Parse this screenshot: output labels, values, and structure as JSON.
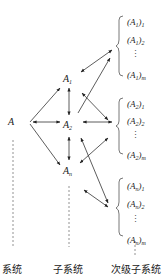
{
  "diagram": {
    "nodes": {
      "system": "A",
      "subsystems": [
        {
          "base": "A",
          "sub": "1"
        },
        {
          "base": "A",
          "sub": "2"
        },
        {
          "base": "A",
          "sub": "n"
        }
      ]
    },
    "groups": [
      {
        "items": [
          {
            "base": "(A",
            "sub1": "1",
            "close": ")",
            "sub2": "1"
          },
          {
            "base": "(A",
            "sub1": "1",
            "close": ")",
            "sub2": "2"
          },
          {
            "base": "(A",
            "sub1": "1",
            "close": ")",
            "sub2": "m"
          }
        ]
      },
      {
        "items": [
          {
            "base": "(A",
            "sub1": "2",
            "close": ")",
            "sub2": "1"
          },
          {
            "base": "(A",
            "sub1": "2",
            "close": ")",
            "sub2": "2"
          },
          {
            "base": "(A",
            "sub1": "2",
            "close": ")",
            "sub2": "m"
          }
        ]
      },
      {
        "items": [
          {
            "base": "(A",
            "sub1": "n",
            "close": ")",
            "sub2": "1"
          },
          {
            "base": "(A",
            "sub1": "n",
            "close": ")",
            "sub2": "2"
          },
          {
            "base": "(A",
            "sub1": "n",
            "close": ")",
            "sub2": "m"
          }
        ]
      }
    ],
    "columns": {
      "system_label": "系统",
      "subsystem_label": "子系统",
      "secondary_label": "次级子系统"
    },
    "vdots": "⋮",
    "line_color": "#333333"
  }
}
